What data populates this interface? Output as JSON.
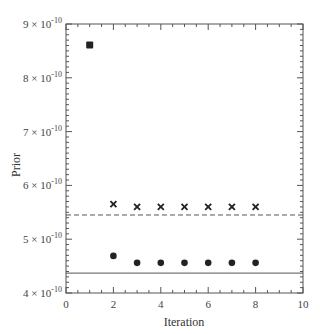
{
  "chart_data": {
    "type": "scatter",
    "title": "",
    "xlabel": "Iteration",
    "ylabel": "Prior",
    "xlim": [
      0,
      10
    ],
    "ylim": [
      4e-10,
      9e-10
    ],
    "x_ticks": [
      0,
      2,
      4,
      6,
      8,
      10
    ],
    "x_tick_labels": [
      "0",
      "2",
      "4",
      "6",
      "8",
      "10"
    ],
    "y_ticks": [
      4e-10,
      5e-10,
      6e-10,
      7e-10,
      8e-10,
      9e-10
    ],
    "y_tick_labels": [
      {
        "mantissa": "4",
        "exp": "-10"
      },
      {
        "mantissa": "5",
        "exp": "-10"
      },
      {
        "mantissa": "6",
        "exp": "-10"
      },
      {
        "mantissa": "7",
        "exp": "-10"
      },
      {
        "mantissa": "8",
        "exp": "-10"
      },
      {
        "mantissa": "9",
        "exp": "-10"
      }
    ],
    "grid": false,
    "legend": null,
    "series": [
      {
        "name": "initial",
        "marker": "square",
        "x": [
          1
        ],
        "y": [
          8.61e-10
        ]
      },
      {
        "name": "upper",
        "marker": "x",
        "x": [
          2,
          3,
          4,
          5,
          6,
          7,
          8
        ],
        "y": [
          5.65e-10,
          5.6e-10,
          5.6e-10,
          5.6e-10,
          5.6e-10,
          5.6e-10,
          5.6e-10
        ]
      },
      {
        "name": "lower",
        "marker": "circle",
        "x": [
          2,
          3,
          4,
          5,
          6,
          7,
          8
        ],
        "y": [
          4.69e-10,
          4.56e-10,
          4.56e-10,
          4.56e-10,
          4.56e-10,
          4.56e-10,
          4.56e-10
        ]
      }
    ],
    "reference_lines": [
      {
        "name": "upper-reference",
        "style": "dashed",
        "y": 5.45e-10
      },
      {
        "name": "lower-reference",
        "style": "solid",
        "y": 4.37e-10
      }
    ]
  },
  "colors": {
    "axis": "#555555",
    "marker": "#222222",
    "line": "#555555"
  }
}
